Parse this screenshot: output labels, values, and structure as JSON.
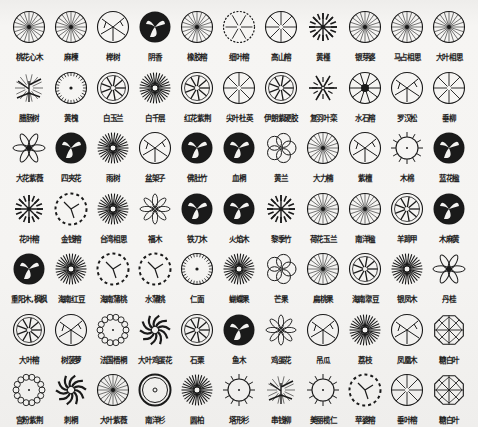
{
  "grid": {
    "columns": 11,
    "rows": 7
  },
  "colors": {
    "ink": "#1a1a1a",
    "paper": "#f4f3f1"
  },
  "rows": [
    {
      "y": 0,
      "items": [
        {
          "label": "桃花心木",
          "icon": "fan-spoke-circle"
        },
        {
          "label": "麻楝",
          "icon": "fan-spoke-circle"
        },
        {
          "label": "榉树",
          "icon": "branch-circle"
        },
        {
          "label": "阴香",
          "icon": "dark-filled-circle"
        },
        {
          "label": "橡胶榕",
          "icon": "fan-spoke-circle"
        },
        {
          "label": "细叶榕",
          "icon": "dotted-branch-circle"
        },
        {
          "label": "高山榕",
          "icon": "spoke-circle"
        },
        {
          "label": "黄槿",
          "icon": "branch-cluster"
        },
        {
          "label": "银芽婆",
          "icon": "fan-spoke-circle"
        },
        {
          "label": "马占相思",
          "icon": "fan-spoke-circle"
        },
        {
          "label": "大叶相思",
          "icon": "fan-spoke-circle"
        }
      ]
    },
    {
      "y": 1,
      "items": [
        {
          "label": "腊肠树",
          "icon": "pine-branch"
        },
        {
          "label": "黄槐",
          "icon": "tick-circle"
        },
        {
          "label": "白玉兰",
          "icon": "wheel-circle"
        },
        {
          "label": "白千层",
          "icon": "sunburst"
        },
        {
          "label": "红花紫荆",
          "icon": "wheel-circle"
        },
        {
          "label": "尖叶杜英",
          "icon": "spoke-circle"
        },
        {
          "label": "伊朗紫硬胶",
          "icon": "wheel-circle"
        },
        {
          "label": "复羽叶栾",
          "icon": "snowflake"
        },
        {
          "label": "水石榕",
          "icon": "star-circle"
        },
        {
          "label": "罗汉松",
          "icon": "branch-circle"
        },
        {
          "label": "垂柳",
          "icon": "spoke-circle"
        }
      ]
    },
    {
      "y": 2,
      "items": [
        {
          "label": "大花紫薇",
          "icon": "six-petal-star"
        },
        {
          "label": "四夹花",
          "icon": "dark-filled-circle"
        },
        {
          "label": "雨树",
          "icon": "sunburst"
        },
        {
          "label": "盆架子",
          "icon": "branch-circle"
        },
        {
          "label": "佛肚竹",
          "icon": "dark-filled-circle"
        },
        {
          "label": "血桐",
          "icon": "dark-filled-circle"
        },
        {
          "label": "黄兰",
          "icon": "five-petal-flower"
        },
        {
          "label": "大力楠",
          "icon": "fan-spoke-circle"
        },
        {
          "label": "紫檀",
          "icon": "branch-circle"
        },
        {
          "label": "木棉",
          "icon": "spiked-circle"
        },
        {
          "label": "蓝花楹",
          "icon": "dark-filled-circle"
        }
      ]
    },
    {
      "y": 3,
      "items": [
        {
          "label": "花叶榕",
          "icon": "branch-cluster"
        },
        {
          "label": "金钱榕",
          "icon": "dashed-circle"
        },
        {
          "label": "台湾相思",
          "icon": "sunburst"
        },
        {
          "label": "福木",
          "icon": "petal-outline"
        },
        {
          "label": "铁刀木",
          "icon": "dark-filled-circle"
        },
        {
          "label": "火焰木",
          "icon": "dark-filled-circle"
        },
        {
          "label": "黎季竹",
          "icon": "branch-cluster"
        },
        {
          "label": "荷花玉兰",
          "icon": "fan-spoke-circle"
        },
        {
          "label": "南洋楹",
          "icon": "fan-spoke-circle"
        },
        {
          "label": "羊蹄甲",
          "icon": "wheel-circle"
        },
        {
          "label": "木麻黄",
          "icon": "dark-filled-circle"
        }
      ]
    },
    {
      "y": 4,
      "items": [
        {
          "label": "重阳木,枫枫",
          "icon": "dark-filled-circle"
        },
        {
          "label": "海南红豆",
          "icon": "sunburst"
        },
        {
          "label": "海南蒲桃",
          "icon": "dashed-circle"
        },
        {
          "label": "水蒲桃",
          "icon": "dashed-circle"
        },
        {
          "label": "仁面",
          "icon": "tick-circle"
        },
        {
          "label": "蝴蝶果",
          "icon": "sunburst"
        },
        {
          "label": "芒果",
          "icon": "five-petal-flower"
        },
        {
          "label": "扁桃果",
          "icon": "fan-spoke-circle"
        },
        {
          "label": "海南翠豆",
          "icon": "wheel-circle"
        },
        {
          "label": "银凤木",
          "icon": "sunburst"
        },
        {
          "label": "丹桂",
          "icon": "six-petal-star"
        }
      ]
    },
    {
      "y": 5,
      "items": [
        {
          "label": "大叶榕",
          "icon": "wheel-circle"
        },
        {
          "label": "树菠萝",
          "icon": "branch-circle"
        },
        {
          "label": "法国梧桐",
          "icon": "scalloped-circle"
        },
        {
          "label": "大叶鸡蛋花",
          "icon": "pinwheel"
        },
        {
          "label": "石栗",
          "icon": "wheel-circle"
        },
        {
          "label": "鱼木",
          "icon": "dark-filled-circle"
        },
        {
          "label": "鸡蛋花",
          "icon": "petal-outline"
        },
        {
          "label": "吊瓜",
          "icon": "branch-circle"
        },
        {
          "label": "荔枝",
          "icon": "sunburst"
        },
        {
          "label": "凤凰木",
          "icon": "branch-circle"
        },
        {
          "label": "糖白叶",
          "icon": "octagon"
        }
      ]
    },
    {
      "y": 6,
      "items": [
        {
          "label": "宫粉紫荆",
          "icon": "scalloped-circle"
        },
        {
          "label": "刺桐",
          "icon": "pinwheel"
        },
        {
          "label": "大叶紫薇",
          "icon": "fan-spoke-circle"
        },
        {
          "label": "南洋杉",
          "icon": "ring-circle"
        },
        {
          "label": "圆柏",
          "icon": "sunburst"
        },
        {
          "label": "塔形杉",
          "icon": "spiked-circle"
        },
        {
          "label": "串钱柳",
          "icon": "pine-branch"
        },
        {
          "label": "美丽榄仁",
          "icon": "spiked-circle"
        },
        {
          "label": "苹婆榕",
          "icon": "dashed-circle"
        },
        {
          "label": "垂叶榕",
          "icon": "spoke-circle"
        },
        {
          "label": "糖白叶",
          "icon": "octagon"
        }
      ]
    }
  ]
}
